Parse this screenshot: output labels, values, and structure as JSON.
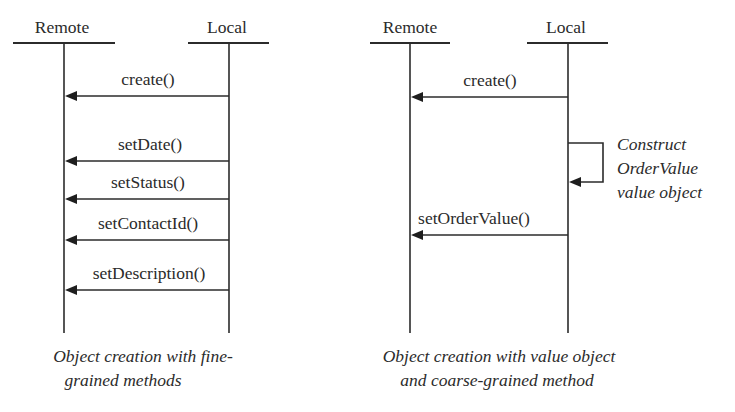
{
  "diagrams": [
    {
      "id": "fine-grained",
      "participants": [
        {
          "label": "Remote",
          "x": 64,
          "head_x1": 13,
          "head_x2": 115
        },
        {
          "label": "Local",
          "x": 229,
          "head_x1": 188,
          "head_x2": 269
        }
      ],
      "header_label_y": 33,
      "header_line_y": 43,
      "lifeline_end_y": 333,
      "messages": [
        {
          "label": "create()",
          "from": "Local",
          "to": "Remote",
          "y": 96,
          "label_x": 148
        },
        {
          "label": "setDate()",
          "from": "Local",
          "to": "Remote",
          "y": 161,
          "label_x": 150
        },
        {
          "label": "setStatus()",
          "from": "Local",
          "to": "Remote",
          "y": 199,
          "label_x": 148
        },
        {
          "label": "setContactId()",
          "from": "Local",
          "to": "Remote",
          "y": 240,
          "label_x": 148
        },
        {
          "label": "setDescription()",
          "from": "Local",
          "to": "Remote",
          "y": 290,
          "label_x": 149
        }
      ],
      "caption": {
        "lines": [
          "Object creation with fine-",
          "grained methods"
        ],
        "center_x": 143,
        "y": [
          362,
          386
        ]
      }
    },
    {
      "id": "value-object",
      "participants": [
        {
          "label": "Remote",
          "x": 410,
          "head_x1": 370,
          "head_x2": 450
        },
        {
          "label": "Local",
          "x": 568,
          "head_x1": 527,
          "head_x2": 608
        }
      ],
      "header_label_y": 33,
      "header_line_y": 43,
      "lifeline_end_y": 333,
      "messages": [
        {
          "label": "create()",
          "from": "Local",
          "to": "Remote",
          "y": 97,
          "label_x": 490
        },
        {
          "label": "setOrderValue()",
          "from": "Local",
          "to": "Remote",
          "y": 235,
          "label_x": 474
        }
      ],
      "self_call": {
        "participant": "Local",
        "y_start": 143,
        "y_end": 182,
        "loop_x": 603,
        "annotation": [
          "Construct",
          "OrderValue",
          "value object"
        ],
        "annotation_x": 617,
        "annotation_y": [
          150,
          174,
          198
        ]
      },
      "caption": {
        "lines": [
          "Object creation with value object",
          "and coarse-grained method"
        ],
        "center_x": 499,
        "y": [
          362,
          386
        ]
      }
    }
  ],
  "colors": {
    "ink": "#2b2b2b",
    "background": "#ffffff"
  }
}
